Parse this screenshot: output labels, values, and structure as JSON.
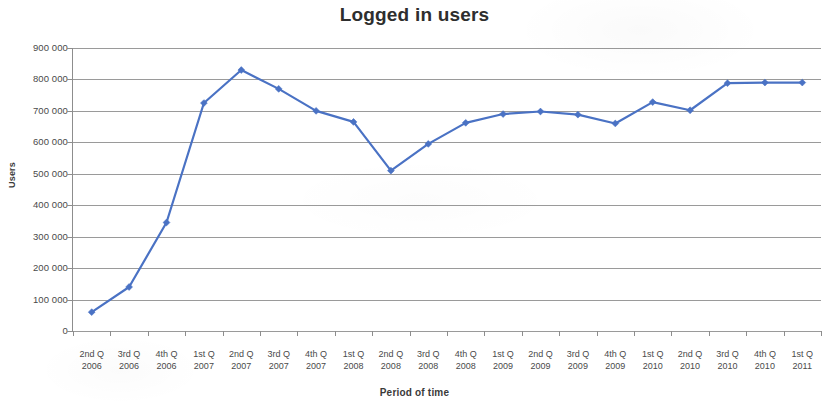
{
  "chart_data": {
    "type": "line",
    "title": "Logged in users",
    "xlabel": "Period of time",
    "ylabel": "Users",
    "ylim": [
      0,
      900000
    ],
    "ytick_step": 100000,
    "grid": true,
    "legend": "none",
    "series_color": "#4a72c4",
    "marker": "diamond",
    "categories": [
      {
        "quarter": "2nd Q",
        "year": "2006"
      },
      {
        "quarter": "3rd Q",
        "year": "2006"
      },
      {
        "quarter": "4th Q",
        "year": "2006"
      },
      {
        "quarter": "1st Q",
        "year": "2007"
      },
      {
        "quarter": "2nd Q",
        "year": "2007"
      },
      {
        "quarter": "3rd Q",
        "year": "2007"
      },
      {
        "quarter": "4th Q",
        "year": "2007"
      },
      {
        "quarter": "1st Q",
        "year": "2008"
      },
      {
        "quarter": "2nd Q",
        "year": "2008"
      },
      {
        "quarter": "3rd Q",
        "year": "2008"
      },
      {
        "quarter": "4th Q",
        "year": "2008"
      },
      {
        "quarter": "1st Q",
        "year": "2009"
      },
      {
        "quarter": "2nd Q",
        "year": "2009"
      },
      {
        "quarter": "3rd Q",
        "year": "2009"
      },
      {
        "quarter": "4th Q",
        "year": "2009"
      },
      {
        "quarter": "1st Q",
        "year": "2010"
      },
      {
        "quarter": "2nd Q",
        "year": "2010"
      },
      {
        "quarter": "3rd Q",
        "year": "2010"
      },
      {
        "quarter": "4th Q",
        "year": "2010"
      },
      {
        "quarter": "1st Q",
        "year": "2011"
      }
    ],
    "values": [
      60000,
      140000,
      345000,
      725000,
      830000,
      770000,
      700000,
      665000,
      510000,
      595000,
      662000,
      690000,
      698000,
      688000,
      660000,
      728000,
      702000,
      788000,
      790000,
      790000
    ],
    "ytick_labels": [
      "900 000",
      "800 000",
      "700 000",
      "600 000",
      "500 000",
      "400 000",
      "300 000",
      "200 000",
      "100 000",
      "0"
    ],
    "ytick_values": [
      900000,
      800000,
      700000,
      600000,
      500000,
      400000,
      300000,
      200000,
      100000,
      0
    ]
  }
}
